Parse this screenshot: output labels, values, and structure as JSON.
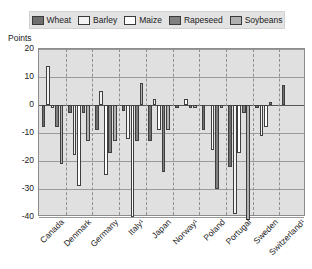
{
  "chart_data": {
    "type": "bar",
    "title": "",
    "subtitle": "",
    "xlabel": "",
    "ylabel": "Points",
    "ylim": [
      -40,
      20
    ],
    "yticks": [
      20,
      10,
      0,
      -10,
      -20,
      -30,
      -40
    ],
    "grid": true,
    "legend_position": "top",
    "categories": [
      "Canada",
      "Denmark",
      "Germany",
      "Italy¹",
      "Japan",
      "Norway¹",
      "Poland",
      "Portugal",
      "Sweden",
      "Switzerland¹"
    ],
    "series": [
      {
        "name": "Wheat",
        "color": "#6e6e6e",
        "values": [
          -8,
          -3,
          -9,
          -2,
          -13,
          -1,
          -9,
          -22,
          -1,
          7
        ]
      },
      {
        "name": "Barley",
        "color": "#f2f2f2",
        "values": [
          14,
          -18,
          5,
          -12,
          2,
          0,
          0,
          -39,
          -11,
          0
        ]
      },
      {
        "name": "Maize",
        "color": "#ffffff",
        "values": [
          -1,
          -29,
          -25,
          -40,
          -9,
          2,
          -16,
          -17,
          -8,
          0
        ]
      },
      {
        "name": "Rapeseed",
        "color": "#808080",
        "values": [
          -8,
          -3,
          -17,
          -13,
          -24,
          -1,
          -30,
          -3,
          1,
          0
        ]
      },
      {
        "name": "Soybeans",
        "color": "#b0b0b0",
        "values": [
          -21,
          -13,
          -13,
          8,
          -9,
          -1,
          -1,
          -41,
          0,
          0
        ]
      }
    ]
  },
  "legend": {
    "items": [
      {
        "label": "Wheat",
        "swatch": "#6e6e6e"
      },
      {
        "label": "Barley",
        "swatch": "#f2f2f2"
      },
      {
        "label": "Maize",
        "swatch": "#ffffff"
      },
      {
        "label": "Rapeseed",
        "swatch": "#808080"
      },
      {
        "label": "Soybeans",
        "swatch": "#b0b0b0"
      }
    ]
  }
}
